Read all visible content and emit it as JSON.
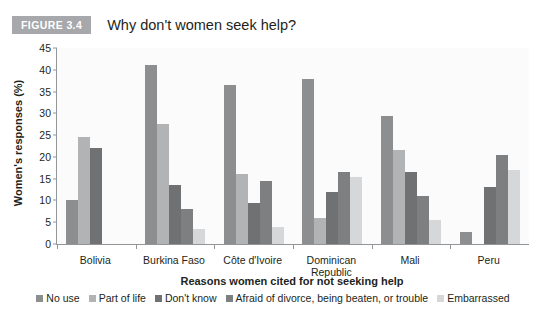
{
  "header": {
    "badge": "FIGURE 3.4",
    "title": "Why don't women seek help?"
  },
  "chart_data": {
    "type": "bar",
    "title": "Why don't women seek help?",
    "xlabel": "Reasons women cited for not seeking help",
    "ylabel": "Women's responses (%)",
    "ylim": [
      0,
      45
    ],
    "yticks": [
      0,
      5,
      10,
      15,
      20,
      25,
      30,
      35,
      40,
      45
    ],
    "grid": false,
    "legend_position": "bottom",
    "categories": [
      "Bolivia",
      "Burkina Faso",
      "Côte d'Ivoire",
      "Dominican\nRepublic",
      "Mali",
      "Peru"
    ],
    "category_lines": [
      [
        "Bolivia"
      ],
      [
        "Burkina Faso"
      ],
      [
        "Côte d'Ivoire"
      ],
      [
        "Dominican",
        "Republic"
      ],
      [
        "Mali"
      ],
      [
        "Peru"
      ]
    ],
    "series": [
      {
        "name": "No use",
        "color": "#8c8e90",
        "values": [
          10.0,
          41.0,
          36.5,
          38.0,
          29.5,
          2.7
        ]
      },
      {
        "name": "Part of life",
        "color": "#b1b3b5",
        "values": [
          24.5,
          27.5,
          16.0,
          6.0,
          21.5,
          0.0
        ]
      },
      {
        "name": "Don't know",
        "color": "#6f7173",
        "values": [
          22.0,
          13.5,
          9.5,
          12.0,
          16.5,
          13.0
        ]
      },
      {
        "name": "Afraid of divorce, being beaten, or trouble",
        "color": "#7d7f81",
        "values": [
          0.0,
          8.0,
          14.5,
          16.5,
          11.0,
          20.5
        ]
      },
      {
        "name": "Embarrassed",
        "color": "#d6d7d8",
        "values": [
          0.0,
          3.5,
          4.0,
          15.5,
          5.5,
          17.0
        ]
      }
    ]
  }
}
